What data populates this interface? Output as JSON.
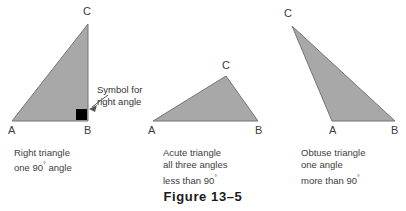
{
  "figure": {
    "label": "Figure 13–5",
    "background_color": "#ffffff",
    "fill_color": "#a8a8a8",
    "stroke_color": "#6e6e6e",
    "text_color": "#3d3d3d",
    "marker_color": "#000000"
  },
  "callout": {
    "line1": "Symbol for",
    "line2": "right angle",
    "target": "right-angle-square"
  },
  "triangles": [
    {
      "id": "right-triangle",
      "vertices": {
        "A": {
          "label": "A",
          "x": 12,
          "y": 121
        },
        "B": {
          "label": "B",
          "x": 88,
          "y": 121
        },
        "C": {
          "label": "C",
          "x": 88,
          "y": 24
        }
      },
      "has_right_angle_marker": true,
      "caption": [
        "Right triangle",
        "one 90° angle"
      ],
      "caption_lines": {
        "line1": "Right triangle",
        "line2_pre": "one 90",
        "line2_deg": "°",
        "line2_post": " angle"
      }
    },
    {
      "id": "acute-triangle",
      "vertices": {
        "A": {
          "label": "A",
          "x": 153,
          "y": 121
        },
        "B": {
          "label": "B",
          "x": 258,
          "y": 121
        },
        "C": {
          "label": "C",
          "x": 226,
          "y": 76
        }
      },
      "has_right_angle_marker": false,
      "caption": [
        "Acute triangle",
        "all three angles",
        "less than 90°"
      ],
      "caption_lines": {
        "line1": "Acute triangle",
        "line2": "all three angles",
        "line3_pre": "less than 90",
        "line3_deg": "°"
      }
    },
    {
      "id": "obtuse-triangle",
      "vertices": {
        "C": {
          "label": "C",
          "x": 292,
          "y": 26
        },
        "A": {
          "label": "A",
          "x": 332,
          "y": 121
        },
        "B": {
          "label": "B",
          "x": 395,
          "y": 121
        }
      },
      "has_right_angle_marker": false,
      "caption": [
        "Obtuse triangle",
        "one angle",
        "more than 90°"
      ],
      "caption_lines": {
        "line1": "Obtuse triangle",
        "line2": "one angle",
        "line3_pre": "more than 90",
        "line3_deg": "°"
      }
    }
  ]
}
